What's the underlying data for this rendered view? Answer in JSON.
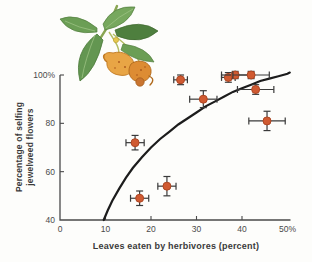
{
  "figure": {
    "xlabel": "Leaves eaten by herbivores (percent)",
    "ylabel_line1": "Percentage of selfing",
    "ylabel_line2": "jewelweed flowers"
  },
  "chart_data": {
    "type": "scatter",
    "title": "",
    "xlabel": "Leaves eaten by herbivores (percent)",
    "ylabel": "Percentage of selfing jewelweed flowers",
    "xlim": [
      0,
      50
    ],
    "ylim": [
      40,
      100
    ],
    "grid": false,
    "legend": "none",
    "x_ticks": [
      {
        "value": 0,
        "label": "0"
      },
      {
        "value": 10,
        "label": "10"
      },
      {
        "value": 20,
        "label": "20"
      },
      {
        "value": 30,
        "label": "30"
      },
      {
        "value": 40,
        "label": "40"
      },
      {
        "value": 50,
        "label": "50%"
      }
    ],
    "y_ticks": [
      {
        "value": 100,
        "label": "100%"
      },
      {
        "value": 80,
        "label": "80"
      },
      {
        "value": 60,
        "label": "60"
      },
      {
        "value": 40,
        "label": "40"
      }
    ],
    "points": [
      {
        "x": 16.5,
        "y": 72,
        "xerr": 2,
        "yerr": 3
      },
      {
        "x": 17.5,
        "y": 49,
        "xerr": 2,
        "yerr": 3
      },
      {
        "x": 23.5,
        "y": 54,
        "xerr": 2,
        "yerr": 4
      },
      {
        "x": 26.5,
        "y": 98,
        "xerr": 1.5,
        "yerr": 2
      },
      {
        "x": 31.5,
        "y": 90,
        "xerr": 3,
        "yerr": 3.5
      },
      {
        "x": 37,
        "y": 99,
        "xerr": 1.5,
        "yerr": 2
      },
      {
        "x": 38.5,
        "y": 100,
        "xerr": 3,
        "yerr": 1.5
      },
      {
        "x": 42,
        "y": 100,
        "xerr": 4,
        "yerr": 1.5
      },
      {
        "x": 43,
        "y": 94,
        "xerr": 4,
        "yerr": 2
      },
      {
        "x": 45.5,
        "y": 81,
        "xerr": 4,
        "yerr": 4
      }
    ],
    "trend_curve": [
      [
        9.6,
        40
      ],
      [
        10.5,
        44
      ],
      [
        11.5,
        48
      ],
      [
        13,
        53
      ],
      [
        14.5,
        57.5
      ],
      [
        16,
        61.5
      ],
      [
        18,
        66
      ],
      [
        20,
        70
      ],
      [
        22,
        73.5
      ],
      [
        24,
        76.5
      ],
      [
        26,
        79.5
      ],
      [
        28,
        82
      ],
      [
        30,
        84.5
      ],
      [
        32,
        87
      ],
      [
        34,
        89
      ],
      [
        36,
        91
      ],
      [
        38,
        93
      ],
      [
        40,
        94.5
      ],
      [
        42,
        96
      ],
      [
        44,
        97.5
      ],
      [
        46,
        98.5
      ],
      [
        48,
        99.5
      ],
      [
        50,
        100.5
      ],
      [
        50.5,
        101
      ]
    ],
    "colors": {
      "marker": "#d05a31",
      "marker_edge": "#ad4724",
      "error_bar": "#3a3a3a",
      "curve": "#1c1c1c",
      "axis": "#4a4a4a",
      "tick_text": "#4a4a4a",
      "label_text": "#3a3a3a",
      "background": "#fdfdfb"
    },
    "layout": {
      "x0": 60,
      "x1": 287.5,
      "y0": 220,
      "y1": 75
    }
  }
}
